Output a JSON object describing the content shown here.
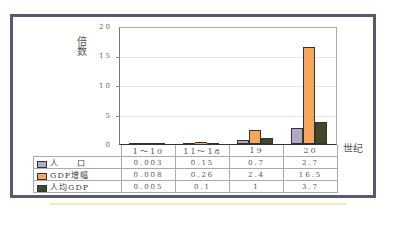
{
  "chart_data": {
    "type": "bar",
    "title": "",
    "ylabel": "倍数",
    "xlabel": "世纪",
    "ylim": [
      0,
      20
    ],
    "yticks": [
      "0",
      "5",
      "10",
      "15",
      "20"
    ],
    "grid": true,
    "legend_position": "data-table",
    "categories": [
      "1～10",
      "11～18",
      "19",
      "20"
    ],
    "series": [
      {
        "name": "人口",
        "label": "人　　口",
        "color": "#b3a9c5",
        "values": [
          0.003,
          0.15,
          0.7,
          2.7
        ],
        "display": [
          "0.003",
          "0.15",
          "0.7",
          "2.7"
        ]
      },
      {
        "name": "GDP增幅",
        "label": "GDP增幅",
        "color": "#f7a65c",
        "values": [
          0.008,
          0.26,
          2.4,
          16.5
        ],
        "display": [
          "0.008",
          "0.26",
          "2.4",
          "16.5"
        ]
      },
      {
        "name": "人均GDP",
        "label": "人均GDP",
        "color": "#3e4a2c",
        "values": [
          0.005,
          0.1,
          1,
          3.7
        ],
        "display": [
          "0.005",
          "0.1",
          "1",
          "3.7"
        ]
      }
    ]
  }
}
